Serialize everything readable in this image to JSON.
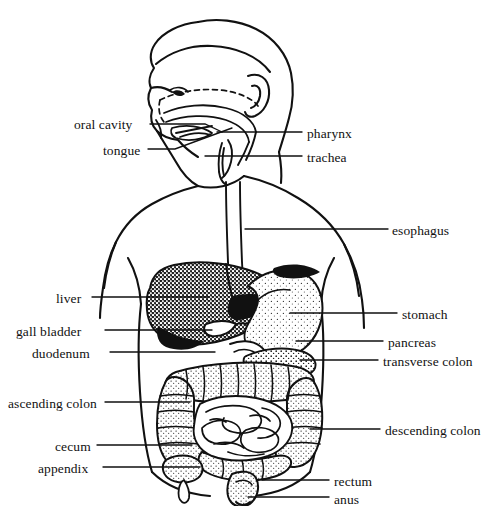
{
  "figure": {
    "view": "anterior body outline with left-facing head profile",
    "background_color": "#ffffff",
    "line_color": "#111111"
  },
  "labels": {
    "left": [
      {
        "id": "oral-cavity",
        "text": "oral cavity",
        "text_x": 74,
        "text_y": 118,
        "leader": [
          [
            150,
            124
          ],
          [
            205,
            124
          ],
          [
            222,
            132
          ]
        ]
      },
      {
        "id": "tongue",
        "text": "tongue",
        "text_x": 103,
        "text_y": 144,
        "leader": [
          [
            148,
            149
          ],
          [
            175,
            149
          ],
          [
            232,
            128
          ]
        ]
      },
      {
        "id": "liver",
        "text": "liver",
        "text_x": 56,
        "text_y": 292,
        "leader": [
          [
            92,
            297
          ],
          [
            208,
            297
          ]
        ]
      },
      {
        "id": "gall-bladder",
        "text": "gall bladder",
        "text_x": 16,
        "text_y": 325,
        "leader": [
          [
            105,
            330
          ],
          [
            212,
            330
          ]
        ]
      },
      {
        "id": "duodenum",
        "text": "duodenum",
        "text_x": 32,
        "text_y": 347,
        "leader": [
          [
            110,
            352
          ],
          [
            215,
            352
          ]
        ]
      },
      {
        "id": "ascending-colon",
        "text": "ascending colon",
        "text_x": 8,
        "text_y": 397,
        "leader": [
          [
            105,
            402
          ],
          [
            190,
            402
          ]
        ]
      },
      {
        "id": "cecum",
        "text": "cecum",
        "text_x": 55,
        "text_y": 440,
        "leader": [
          [
            97,
            445
          ],
          [
            192,
            445
          ]
        ]
      },
      {
        "id": "appendix",
        "text": "appendix",
        "text_x": 38,
        "text_y": 462,
        "leader": [
          [
            103,
            467
          ],
          [
            200,
            467
          ]
        ]
      }
    ],
    "right": [
      {
        "id": "pharynx",
        "text": "pharynx",
        "text_x": 307,
        "text_y": 127,
        "leader": [
          [
            217,
            132
          ],
          [
            302,
            132
          ]
        ]
      },
      {
        "id": "trachea",
        "text": "trachea",
        "text_x": 307,
        "text_y": 151,
        "leader": [
          [
            205,
            156
          ],
          [
            302,
            156
          ]
        ]
      },
      {
        "id": "esophagus",
        "text": "esophagus",
        "text_x": 392,
        "text_y": 224,
        "leader": [
          [
            245,
            229
          ],
          [
            388,
            229
          ]
        ]
      },
      {
        "id": "stomach",
        "text": "stomach",
        "text_x": 402,
        "text_y": 308,
        "leader": [
          [
            290,
            313
          ],
          [
            397,
            313
          ]
        ]
      },
      {
        "id": "pancreas",
        "text": "pancreas",
        "text_x": 388,
        "text_y": 336,
        "leader": [
          [
            296,
            341
          ],
          [
            383,
            341
          ]
        ]
      },
      {
        "id": "transverse-colon",
        "text": "transverse colon",
        "text_x": 383,
        "text_y": 355,
        "leader": [
          [
            300,
            360
          ],
          [
            378,
            360
          ]
        ]
      },
      {
        "id": "descending-colon",
        "text": "descending colon",
        "text_x": 385,
        "text_y": 424,
        "leader": [
          [
            310,
            429
          ],
          [
            380,
            429
          ]
        ]
      },
      {
        "id": "rectum",
        "text": "rectum",
        "text_x": 334,
        "text_y": 475,
        "leader": [
          [
            262,
            480
          ],
          [
            329,
            480
          ]
        ]
      },
      {
        "id": "anus",
        "text": "anus",
        "text_x": 334,
        "text_y": 493,
        "leader": [
          [
            248,
            497
          ],
          [
            329,
            497
          ]
        ]
      }
    ]
  },
  "organ_shading": {
    "liver": "dense stipple (dark)",
    "stomach": "light stipple",
    "pancreas": "medium stipple",
    "large_intestine": "haustrated stipple ring",
    "small_intestine": "plain outlined coils",
    "rectum": "stipple"
  }
}
